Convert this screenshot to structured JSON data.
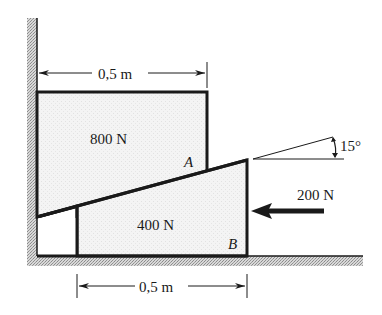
{
  "diagram": {
    "type": "statics wedge problem",
    "colors": {
      "stroke": "#1a1a1a",
      "block_fill": "#f1f1f1",
      "hatch": "#9a9a9a",
      "background": "#ffffff"
    },
    "upper_block": {
      "weight_label": "800 N",
      "contact_point_label": "A"
    },
    "wedge": {
      "weight_label": "400 N",
      "contact_point_label": "B"
    },
    "applied_force": {
      "label": "200 N",
      "direction": "left"
    },
    "incline_angle": {
      "label": "15°"
    },
    "dimensions": {
      "top_width_label": "0,5 m",
      "bottom_width_label": "0,5 m"
    }
  }
}
